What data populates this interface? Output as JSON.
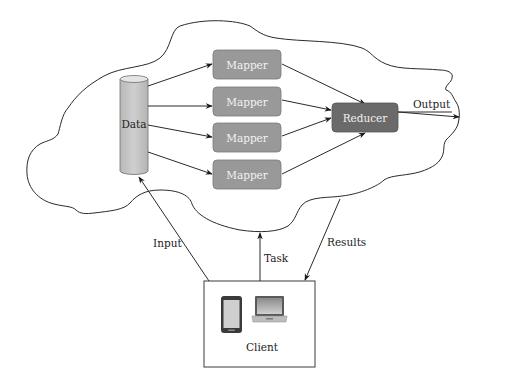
{
  "diagram": {
    "cloud": {
      "data_store": {
        "label": "Data",
        "icon": "database-cylinder-icon"
      },
      "mappers": [
        {
          "label": "Mapper"
        },
        {
          "label": "Mapper"
        },
        {
          "label": "Mapper"
        },
        {
          "label": "Mapper"
        }
      ],
      "reducer": {
        "label": "Reducer"
      },
      "output": {
        "label": "Output"
      }
    },
    "client": {
      "label": "Client",
      "icons": [
        "smartphone-icon",
        "laptop-icon"
      ]
    },
    "edges": {
      "input": "Input",
      "task": "Task",
      "results": "Results"
    },
    "colors": {
      "mapper_fill": "#999999",
      "reducer_fill": "#6a6a6a",
      "cylinder_fill": "#c4c4c4",
      "line": "#2a2a2a"
    }
  }
}
